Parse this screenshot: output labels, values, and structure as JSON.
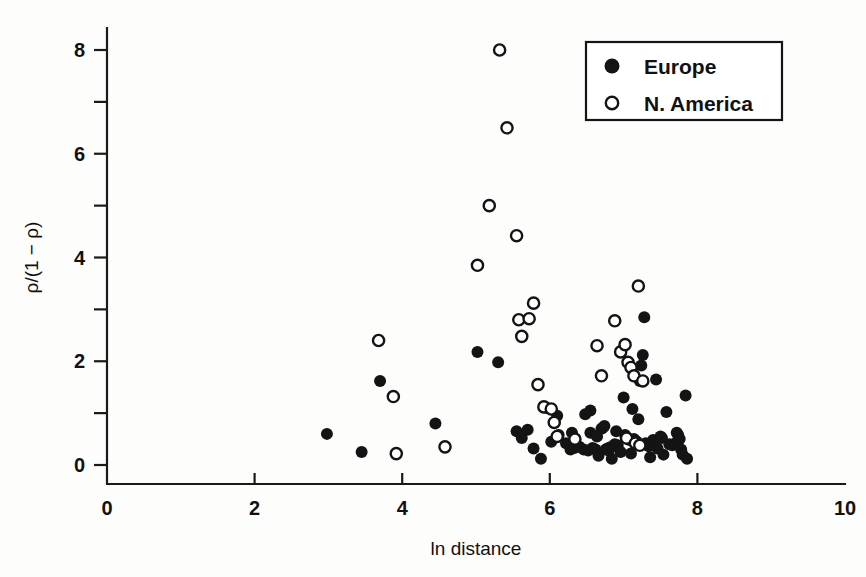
{
  "chart_data": {
    "type": "scatter",
    "title": "",
    "xlabel": "ln distance",
    "ylabel": "ρ/(1 − ρ)",
    "xlim": [
      0,
      10
    ],
    "ylim": [
      0,
      8.6
    ],
    "xticks": [
      0,
      2,
      4,
      6,
      8,
      10
    ],
    "xticklabels": [
      "0",
      "2",
      "4",
      "6",
      "8",
      "10"
    ],
    "yticks": [
      0,
      2,
      4,
      6,
      8
    ],
    "yticklabels": [
      "0",
      "2",
      "4",
      "6",
      "8"
    ],
    "yminorticks": [
      1,
      3,
      5,
      7
    ],
    "grid": false,
    "legend_position": "top-right",
    "series": [
      {
        "name": "Europe",
        "marker": "filled-circle",
        "color": "#141414",
        "points": [
          [
            2.98,
            0.6
          ],
          [
            3.45,
            0.25
          ],
          [
            3.7,
            1.62
          ],
          [
            4.45,
            0.8
          ],
          [
            5.02,
            2.18
          ],
          [
            5.3,
            1.98
          ],
          [
            5.55,
            0.65
          ],
          [
            5.62,
            0.52
          ],
          [
            5.78,
            0.32
          ],
          [
            5.88,
            0.12
          ],
          [
            5.96,
            1.1
          ],
          [
            6.02,
            0.45
          ],
          [
            6.1,
            0.95
          ],
          [
            6.12,
            0.58
          ],
          [
            6.22,
            0.42
          ],
          [
            6.28,
            0.3
          ],
          [
            6.34,
            0.33
          ],
          [
            6.4,
            0.35
          ],
          [
            6.46,
            0.3
          ],
          [
            6.52,
            0.28
          ],
          [
            6.55,
            0.62
          ],
          [
            6.58,
            0.33
          ],
          [
            6.62,
            0.3
          ],
          [
            6.64,
            0.55
          ],
          [
            6.66,
            0.18
          ],
          [
            6.7,
            0.7
          ],
          [
            6.72,
            0.72
          ],
          [
            6.74,
            0.75
          ],
          [
            6.76,
            0.3
          ],
          [
            6.78,
            0.32
          ],
          [
            6.8,
            0.28
          ],
          [
            6.82,
            0.34
          ],
          [
            6.84,
            0.12
          ],
          [
            6.88,
            0.4
          ],
          [
            6.92,
            0.38
          ],
          [
            6.96,
            0.25
          ],
          [
            7.0,
            1.3
          ],
          [
            7.02,
            0.58
          ],
          [
            7.05,
            0.52
          ],
          [
            7.08,
            0.48
          ],
          [
            7.1,
            0.22
          ],
          [
            7.14,
            0.5
          ],
          [
            7.16,
            0.47
          ],
          [
            7.18,
            0.45
          ],
          [
            7.2,
            0.88
          ],
          [
            7.22,
            1.62
          ],
          [
            7.24,
            1.92
          ],
          [
            7.26,
            2.12
          ],
          [
            7.28,
            2.85
          ],
          [
            7.3,
            0.42
          ],
          [
            7.32,
            0.4
          ],
          [
            7.34,
            0.36
          ],
          [
            7.36,
            0.15
          ],
          [
            7.4,
            0.48
          ],
          [
            7.42,
            0.46
          ],
          [
            7.44,
            1.65
          ],
          [
            7.46,
            0.32
          ],
          [
            7.5,
            0.55
          ],
          [
            7.52,
            0.52
          ],
          [
            7.54,
            0.2
          ],
          [
            7.58,
            1.02
          ],
          [
            7.62,
            0.4
          ],
          [
            7.66,
            0.38
          ],
          [
            7.7,
            0.42
          ],
          [
            7.72,
            0.62
          ],
          [
            7.74,
            0.58
          ],
          [
            7.76,
            0.5
          ],
          [
            7.78,
            0.3
          ],
          [
            7.8,
            0.2
          ],
          [
            7.84,
            1.34
          ],
          [
            7.86,
            0.12
          ],
          [
            6.48,
            0.98
          ],
          [
            6.55,
            1.05
          ],
          [
            7.12,
            1.08
          ],
          [
            6.9,
            0.65
          ],
          [
            6.3,
            0.62
          ],
          [
            5.7,
            0.68
          ]
        ]
      },
      {
        "name": "N. America",
        "marker": "open-circle",
        "color": "#141414",
        "points": [
          [
            3.68,
            2.4
          ],
          [
            3.88,
            1.32
          ],
          [
            3.92,
            0.22
          ],
          [
            4.58,
            0.35
          ],
          [
            5.02,
            3.85
          ],
          [
            5.18,
            5.0
          ],
          [
            5.32,
            8.0
          ],
          [
            5.42,
            6.5
          ],
          [
            5.55,
            4.42
          ],
          [
            5.58,
            2.8
          ],
          [
            5.62,
            2.48
          ],
          [
            5.72,
            2.82
          ],
          [
            5.78,
            3.12
          ],
          [
            5.84,
            1.55
          ],
          [
            5.92,
            1.12
          ],
          [
            6.02,
            1.08
          ],
          [
            6.06,
            0.82
          ],
          [
            6.1,
            0.55
          ],
          [
            6.64,
            2.3
          ],
          [
            6.7,
            1.72
          ],
          [
            6.88,
            2.78
          ],
          [
            6.96,
            2.18
          ],
          [
            7.02,
            2.32
          ],
          [
            7.06,
            1.98
          ],
          [
            7.1,
            1.88
          ],
          [
            7.14,
            1.72
          ],
          [
            7.2,
            3.45
          ],
          [
            7.26,
            1.62
          ],
          [
            7.04,
            0.52
          ],
          [
            7.16,
            0.42
          ],
          [
            7.22,
            0.38
          ],
          [
            6.34,
            0.5
          ]
        ]
      }
    ]
  },
  "legend": {
    "items": [
      {
        "label": "Europe",
        "marker": "filled-circle"
      },
      {
        "label": "N. America",
        "marker": "open-circle"
      }
    ]
  }
}
